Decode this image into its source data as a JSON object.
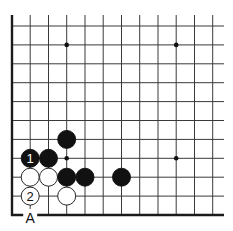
{
  "diagram": {
    "type": "go-board-corner",
    "corner": "bottom-left",
    "columns_x": [
      12,
      30.2,
      48.5,
      66.7,
      85,
      103.2,
      121.5,
      139.7,
      158,
      176.2,
      194.5,
      212.7
    ],
    "rows_y": [
      26,
      44.9,
      63.8,
      82.7,
      101.6,
      120.5,
      139.4,
      158.3,
      177.2,
      196.1,
      215
    ],
    "right_extent_x": 224,
    "top_extent_y": 15,
    "line_color": "#3a3a3a",
    "edge_color": "#1a1a1a",
    "star_points": [
      {
        "col": 3,
        "row": 1
      },
      {
        "col": 9,
        "row": 1
      },
      {
        "col": 3,
        "row": 7
      },
      {
        "col": 9,
        "row": 7
      }
    ],
    "stones": [
      {
        "color": "black",
        "col": 3,
        "row": 6,
        "label": ""
      },
      {
        "color": "black",
        "col": 1,
        "row": 7,
        "label": "1"
      },
      {
        "color": "black",
        "col": 2,
        "row": 7,
        "label": ""
      },
      {
        "color": "white",
        "col": 1,
        "row": 8,
        "label": ""
      },
      {
        "color": "white",
        "col": 2,
        "row": 8,
        "label": ""
      },
      {
        "color": "black",
        "col": 3,
        "row": 8,
        "label": ""
      },
      {
        "color": "black",
        "col": 4,
        "row": 8,
        "label": ""
      },
      {
        "color": "black",
        "col": 6,
        "row": 8,
        "label": ""
      },
      {
        "color": "white",
        "col": 1,
        "row": 9,
        "label": "2"
      },
      {
        "color": "white",
        "col": 3,
        "row": 9,
        "label": ""
      }
    ],
    "point_labels": [
      {
        "text": "A",
        "col": 1,
        "row": 10
      }
    ]
  }
}
